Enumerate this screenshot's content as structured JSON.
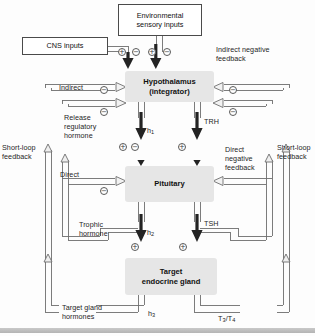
{
  "diagram": {
    "accent_box_fill": "#e6e6e6",
    "line_color": "#6e6e6e",
    "arrow_color": "#2b2b2b"
  },
  "boxes": {
    "environmental": "Environmental\nsensory inputs",
    "cns": "CNS inputs",
    "hypothalamus": "Hypothalamus\n(integrator)",
    "pituitary": "Pituitary",
    "target_gland": "Target\nendocrine gland"
  },
  "labels": {
    "indirect_negative_feedback": "Indirect negative\nfeedback",
    "indirect": "Indirect",
    "direct": "Direct",
    "release_regulatory_hormone": "Release\nregulatory\nhormone",
    "direct_negative_feedback": "Direct\nnegative\nfeedback",
    "short_loop_left": "Short-loop\nfeedback",
    "short_loop_right": "Short-loop\nfeedback",
    "trophic_hormone": "Trophic\nhormone",
    "target_gland_hormones": "Target gland\nhormones"
  },
  "hormones": {
    "h1": "h",
    "h1_sub": "1",
    "h2": "h",
    "h2_sub": "2",
    "h3": "h",
    "h3_sub": "3",
    "trh": "TRH",
    "tsh": "TSH",
    "t3t4_a": "T",
    "t3t4_sub_a": "3",
    "t3t4_mid": "/T",
    "t3t4_sub_b": "4"
  },
  "symbols": {
    "plus": "+",
    "minus": "−",
    "top_row": [
      "+",
      "−",
      "+",
      "−"
    ],
    "hypothalamus_left_1": "−",
    "hypothalamus_left_2": "−",
    "hypothalamus_right_1": "−",
    "hypothalamus_right_2": "−",
    "h1_plus": "+",
    "h1_minus": "−",
    "trh_plus": "+",
    "pituitary_left_minus": "−",
    "h2_plus": "+",
    "tsh_plus": "+"
  }
}
